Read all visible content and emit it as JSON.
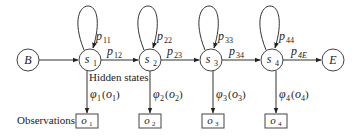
{
  "diagram": {
    "start_node": {
      "label": "B"
    },
    "end_node": {
      "label": "E"
    },
    "states": [
      {
        "id": "s1",
        "label": "s",
        "sub": "1",
        "self_loop": "p",
        "self_loop_sub": "11",
        "emission": "φ",
        "emission_sub": "1",
        "emission_arg": "o",
        "emission_arg_sub": "1"
      },
      {
        "id": "s2",
        "label": "s",
        "sub": "2",
        "self_loop": "p",
        "self_loop_sub": "22",
        "emission": "φ",
        "emission_sub": "2",
        "emission_arg": "o",
        "emission_arg_sub": "2"
      },
      {
        "id": "s3",
        "label": "s",
        "sub": "3",
        "self_loop": "p",
        "self_loop_sub": "33",
        "emission": "φ",
        "emission_sub": "3",
        "emission_arg": "o",
        "emission_arg_sub": "3"
      },
      {
        "id": "s4",
        "label": "s",
        "sub": "4",
        "self_loop": "p",
        "self_loop_sub": "44",
        "emission": "φ",
        "emission_sub": "4",
        "emission_arg": "o",
        "emission_arg_sub": "4"
      }
    ],
    "transitions": [
      {
        "from": "B",
        "to": "s1",
        "label": "",
        "sub": ""
      },
      {
        "from": "s1",
        "to": "s2",
        "label": "p",
        "sub": "12"
      },
      {
        "from": "s2",
        "to": "s3",
        "label": "p",
        "sub": "23"
      },
      {
        "from": "s3",
        "to": "s4",
        "label": "p",
        "sub": "34"
      },
      {
        "from": "s4",
        "to": "E",
        "label": "p",
        "sub": "4E"
      }
    ],
    "observations": [
      {
        "label": "o",
        "sub": "1"
      },
      {
        "label": "o",
        "sub": "2"
      },
      {
        "label": "o",
        "sub": "3"
      },
      {
        "label": "o",
        "sub": "4"
      }
    ],
    "annotations": {
      "hidden_states": "Hidden states",
      "observations": "Observations"
    }
  }
}
